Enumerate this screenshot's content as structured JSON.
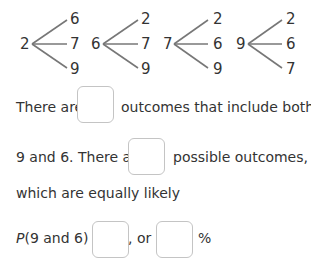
{
  "tree_diagrams": [
    {
      "root": "2",
      "branches": [
        "6",
        "7",
        "9"
      ]
    },
    {
      "root": "6",
      "branches": [
        "2",
        "7",
        "9"
      ]
    },
    {
      "root": "7",
      "branches": [
        "2",
        "6",
        "9"
      ]
    },
    {
      "root": "9",
      "branches": [
        "2",
        "6",
        "7"
      ]
    }
  ],
  "sentences": {
    "line1_before": "There are",
    "line1_after": "outcomes that include both",
    "line2_before": "9 and 6. There are",
    "line2_after": "possible outcomes,",
    "line3": "which are equally likely",
    "prob_p": "P",
    "prob_expr": "(9 and 6) =",
    "prob_or": ", or",
    "prob_percent": "%"
  },
  "answer_boxes": {
    "outcomes_with_9_and_6": "",
    "total_outcomes": "",
    "probability_fraction": "",
    "probability_percent": ""
  }
}
